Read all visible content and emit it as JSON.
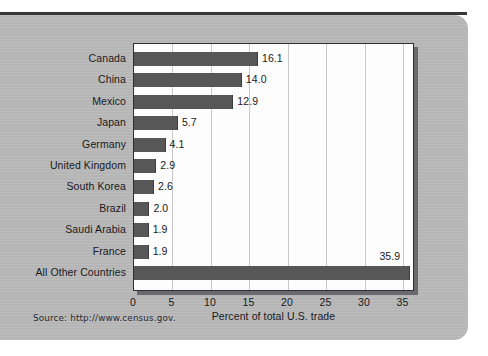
{
  "chart_data": {
    "type": "bar",
    "orientation": "horizontal",
    "title": "",
    "xlabel": "Percent of total U.S. trade",
    "ylabel": "",
    "xlim": [
      0,
      36.5
    ],
    "xticks": [
      0,
      5,
      10,
      15,
      20,
      25,
      30,
      35
    ],
    "xtick_labels": [
      "0",
      "5",
      "10",
      "15",
      "20",
      "25",
      "30",
      "35"
    ],
    "grid": "vertical",
    "legend": "none",
    "categories": [
      "Canada",
      "China",
      "Mexico",
      "Japan",
      "Germany",
      "United Kingdom",
      "South Korea",
      "Brazil",
      "Saudi Arabia",
      "France",
      "All Other Countries"
    ],
    "values": [
      16.1,
      14.0,
      12.9,
      5.7,
      4.1,
      2.9,
      2.6,
      2.0,
      1.9,
      1.9,
      35.9
    ],
    "value_labels": [
      "16.1",
      "14.0",
      "12.9",
      "5.7",
      "4.1",
      "2.9",
      "2.6",
      "2.0",
      "1.9",
      "1.9",
      "35.9"
    ],
    "bar_color": "#575757",
    "plot_background": "#fdfdfd",
    "page_background": "#b9b9b9"
  },
  "source_note": "Source: http://www.census.gov."
}
